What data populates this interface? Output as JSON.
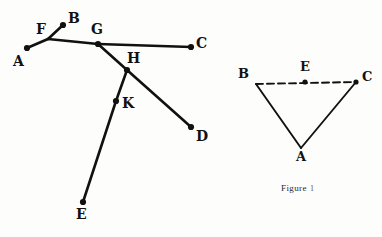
{
  "page": {
    "background_color": "#fdfdfc",
    "ink_color": "#111111",
    "width": 382,
    "height": 237
  },
  "figures": [
    {
      "id": "left-figure",
      "name": "line-segment-network-figure",
      "caption": null,
      "points": [
        {
          "label": "A",
          "name": "point-a",
          "x": 27,
          "y": 48,
          "dot": true,
          "label_x": 13,
          "label_y": 54
        },
        {
          "label": "B",
          "name": "point-b",
          "x": 63,
          "y": 25,
          "dot": true,
          "label_x": 68,
          "label_y": 11
        },
        {
          "label": "C",
          "name": "point-c",
          "x": 191,
          "y": 47,
          "dot": true,
          "label_x": 196,
          "label_y": 36
        },
        {
          "label": "D",
          "name": "point-d",
          "x": 191,
          "y": 127,
          "dot": true,
          "label_x": 196,
          "label_y": 129
        },
        {
          "label": "E",
          "name": "point-e",
          "x": 83,
          "y": 202,
          "dot": true,
          "label_x": 76,
          "label_y": 207
        },
        {
          "label": "F",
          "name": "point-f",
          "x": 48,
          "y": 39,
          "dot": false,
          "label_x": 36,
          "label_y": 22
        },
        {
          "label": "G",
          "name": "point-g",
          "x": 98,
          "y": 44,
          "dot": true,
          "label_x": 91,
          "label_y": 22
        },
        {
          "label": "H",
          "name": "point-h",
          "x": 127,
          "y": 70,
          "dot": true,
          "label_x": 127,
          "label_y": 51
        },
        {
          "label": "K",
          "name": "point-k",
          "x": 116,
          "y": 101,
          "dot": true,
          "label_x": 122,
          "label_y": 96
        }
      ],
      "segments": [
        {
          "name": "segment-a-f",
          "from": "A",
          "to": "F",
          "style": "solid"
        },
        {
          "name": "segment-f-b",
          "from": "F",
          "to": "B",
          "style": "solid"
        },
        {
          "name": "segment-f-g",
          "from": "F",
          "to": "G",
          "style": "solid"
        },
        {
          "name": "segment-g-c",
          "from": "G",
          "to": "C",
          "style": "solid"
        },
        {
          "name": "segment-g-h",
          "from": "G",
          "to": "H",
          "style": "solid"
        },
        {
          "name": "segment-h-d",
          "from": "H",
          "to": "D",
          "style": "solid"
        },
        {
          "name": "segment-h-k",
          "from": "H",
          "to": "K",
          "style": "solid"
        },
        {
          "name": "segment-k-e",
          "from": "K",
          "to": "E",
          "style": "solid"
        }
      ]
    },
    {
      "id": "right-figure",
      "name": "triangle-figure",
      "caption": "Figure",
      "caption_number": "1",
      "caption_x": 281,
      "caption_y": 183,
      "points": [
        {
          "label": "A",
          "name": "triangle-vertex-a",
          "x": 301,
          "y": 148,
          "dot": false,
          "label_x": 296,
          "label_y": 150
        },
        {
          "label": "B",
          "name": "triangle-vertex-b",
          "x": 256,
          "y": 84,
          "dot": false,
          "label_x": 238,
          "label_y": 67
        },
        {
          "label": "C",
          "name": "triangle-vertex-c",
          "x": 356,
          "y": 82,
          "dot": true,
          "label_x": 362,
          "label_y": 70
        },
        {
          "label": "E",
          "name": "triangle-midpoint-e",
          "x": 305,
          "y": 82,
          "dot": true,
          "label_x": 300,
          "label_y": 60
        }
      ],
      "segments": [
        {
          "name": "segment-b-a",
          "from": "B",
          "to": "A",
          "style": "solid"
        },
        {
          "name": "segment-a-c",
          "from": "A",
          "to": "C",
          "style": "solid"
        },
        {
          "name": "segment-b-c",
          "from": "B",
          "to": "C",
          "style": "dashed"
        }
      ]
    }
  ]
}
